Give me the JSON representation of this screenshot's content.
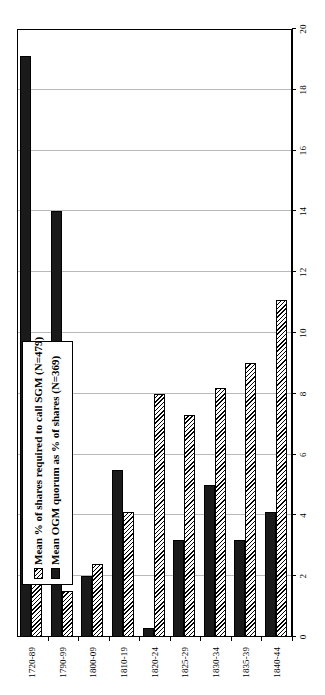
{
  "chart_data": {
    "type": "bar",
    "orientation": "horizontal",
    "title": "",
    "xlabel": "",
    "ylabel": "",
    "xlim": [
      0,
      20
    ],
    "xticks": [
      "0",
      "2",
      "4",
      "6",
      "8",
      "10",
      "12",
      "14",
      "16",
      "18",
      "20"
    ],
    "grid": true,
    "legend_position": "upper-left-inside",
    "categories": [
      "1720-89",
      "1790-99",
      "1800-09",
      "1810-19",
      "1820-24",
      "1825-29",
      "1830-34",
      "1835-39",
      "1840-44"
    ],
    "series": [
      {
        "name": "Mean % of shares required to call SGM (N=479)",
        "style": "hatched",
        "color": "#ffffff",
        "values": [
          2.3,
          1.5,
          2.4,
          4.1,
          8.0,
          7.3,
          8.2,
          9.0,
          11.1
        ]
      },
      {
        "name": "Mean OGM quorum as % of shares (N=369)",
        "style": "solid",
        "color": "#1a1a1a",
        "values": [
          19.1,
          14.0,
          2.0,
          5.5,
          0.3,
          3.2,
          5.0,
          3.2,
          4.1
        ]
      }
    ]
  },
  "legend": {
    "items": [
      {
        "label": "Mean % of shares required to call SGM (N=479)",
        "swatch": "hatched"
      },
      {
        "label": "Mean OGM quorum as % of shares (N=369)",
        "swatch": "solid"
      }
    ]
  }
}
